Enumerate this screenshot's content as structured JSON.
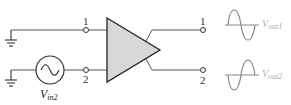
{
  "diagram": {
    "type": "differential-amplifier-schematic",
    "inputs": [
      {
        "terminal": "1",
        "source": "ground"
      },
      {
        "terminal": "2",
        "source": "ac-source",
        "label_main": "V",
        "label_sub": "in2"
      }
    ],
    "outputs": [
      {
        "terminal": "1",
        "label_main": "V",
        "label_sub": "out1",
        "waveform": "sine-positive-first"
      },
      {
        "terminal": "2",
        "label_main": "V",
        "label_sub": "out2",
        "waveform": "sine-negative-first"
      }
    ],
    "colors": {
      "wire": "#555555",
      "amplifier_fill": "#d8d8d8",
      "amplifier_stroke": "#222222",
      "output_label": "#aaaaaa"
    }
  }
}
